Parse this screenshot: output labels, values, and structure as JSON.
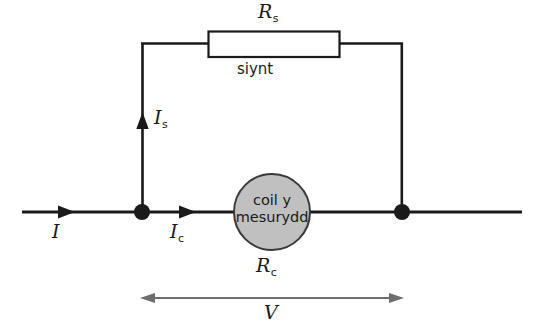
{
  "diagram": {
    "colors": {
      "wire": "#1a1a1a",
      "coil_fill": "#c0c0c0",
      "coil_stroke": "#3a3a3a",
      "resistor_fill": "#ffffff",
      "resistor_stroke": "#1a1a1a",
      "dimension_arrow": "#6e6e6e",
      "text": "#1a1a1a"
    },
    "components": {
      "shunt_resistor": {
        "symbol_letter": "R",
        "symbol_subscript": "s",
        "caption": "siynt"
      },
      "meter_coil": {
        "line1": "coil y",
        "line2": "mesurydd",
        "symbol_letter": "R",
        "symbol_subscript": "c"
      }
    },
    "currents": {
      "total": {
        "letter": "I",
        "subscript": ""
      },
      "shunt": {
        "letter": "I",
        "subscript": "s"
      },
      "coil": {
        "letter": "I",
        "subscript": "c"
      }
    },
    "voltage": {
      "letter": "V",
      "subscript": ""
    },
    "nodes": [
      {
        "name": "left-junction",
        "x": 142,
        "y": 212
      },
      {
        "name": "right-junction",
        "x": 402,
        "y": 212
      }
    ]
  }
}
